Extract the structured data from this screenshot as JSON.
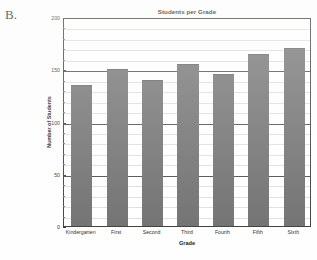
{
  "figure": {
    "label": "B."
  },
  "chart_data": {
    "type": "bar",
    "title": "Students per Grade",
    "xlabel": "Grade",
    "ylabel": "Number of Students",
    "categories": [
      "Kindergarten",
      "First",
      "Second",
      "Third",
      "Fourth",
      "Fifth",
      "Sixth"
    ],
    "values": [
      135,
      150,
      140,
      155,
      145,
      165,
      170
    ],
    "ylim": [
      0,
      200
    ],
    "ymajor_ticks": [
      0,
      50,
      100,
      150,
      200
    ],
    "ytick_labels": [
      "0",
      "50",
      "100",
      "150",
      "200"
    ],
    "yminor_step": 10,
    "grid": "horizontal-minor-and-major",
    "legend": "none",
    "bar_color": "#6e6e6e",
    "axis_color": "#3a3a3a",
    "gridline_minor_color": "#dedede"
  }
}
